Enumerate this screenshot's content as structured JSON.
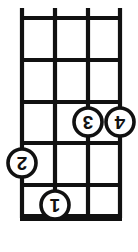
{
  "diagram": {
    "instrument_strings": 4,
    "fret_count": 5,
    "orientation": "rotated-180",
    "nut": {
      "present": true,
      "position": "bottom",
      "label": "nut"
    },
    "colors": {
      "ink": "#111111",
      "background": "#ffffff",
      "dot_fill": "#ffffff"
    },
    "strings": [
      {
        "name": "string-1",
        "x": 22
      },
      {
        "name": "string-2",
        "x": 55
      },
      {
        "name": "string-3",
        "x": 88
      },
      {
        "name": "string-4",
        "x": 120
      }
    ],
    "frets": [
      {
        "name": "fret-line-1",
        "y": 18
      },
      {
        "name": "fret-line-2",
        "y": 60
      },
      {
        "name": "fret-line-3",
        "y": 102
      },
      {
        "name": "fret-line-4",
        "y": 143
      },
      {
        "name": "fret-line-5",
        "y": 185
      }
    ],
    "nut_bar": {
      "x": 20,
      "y": 214,
      "width": 102,
      "height": 7
    },
    "string_overhang_top": 10,
    "fingerings": [
      {
        "label": "1",
        "cx": 55,
        "cy": 205,
        "r": 14,
        "string": 2,
        "fret": 1
      },
      {
        "label": "2",
        "cx": 22,
        "cy": 163,
        "r": 14,
        "string": 1,
        "fret": 2
      },
      {
        "label": "3",
        "cx": 88,
        "cy": 122,
        "r": 14,
        "string": 3,
        "fret": 3
      },
      {
        "label": "4",
        "cx": 120,
        "cy": 122,
        "r": 14,
        "string": 4,
        "fret": 3
      }
    ]
  }
}
